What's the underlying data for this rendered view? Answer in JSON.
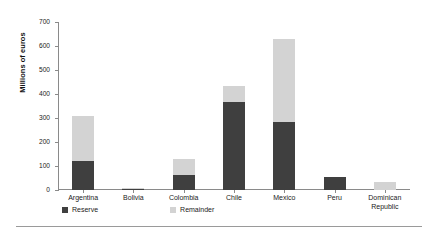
{
  "chart_data": {
    "type": "bar",
    "subtype": "stacked-vertical",
    "title": "",
    "subtitle": "",
    "xlabel": "",
    "ylabel": "Millions of euros",
    "categories": [
      "Argentina",
      "Bolivia",
      "Colombia",
      "Chile",
      "Mexico",
      "Peru",
      "Dominican Republic"
    ],
    "series": [
      {
        "name": "Reserve",
        "color": "#3f3f3f",
        "values": [
          120,
          3,
          63,
          365,
          283,
          55,
          2
        ]
      },
      {
        "name": "Remainder",
        "color": "#d3d3d3",
        "values": [
          190,
          7,
          67,
          70,
          347,
          0,
          33
        ]
      }
    ],
    "totals": [
      310,
      10,
      130,
      435,
      630,
      55,
      35
    ],
    "ylim": [
      0,
      700
    ],
    "ytick_step": 100,
    "yticks": [
      0,
      100,
      200,
      300,
      400,
      500,
      600,
      700
    ],
    "ytick_labels": [
      "0",
      "100",
      "200",
      "300",
      "400",
      "500",
      "600",
      "700"
    ],
    "grid": false,
    "legend_position": "bottom-left",
    "axis_color": "#8a8a8a"
  },
  "legend": {
    "items": [
      {
        "label": "Reserve",
        "color": "#3f3f3f"
      },
      {
        "label": "Remainder",
        "color": "#d3d3d3"
      }
    ]
  },
  "axis": {
    "ylabel": "Millions of euros",
    "ytick_labels": [
      "700",
      "600",
      "500",
      "400",
      "300",
      "200",
      "100",
      "0"
    ],
    "xtick_labels": [
      "Argentina",
      "Bolivia",
      "Colombia",
      "Chile",
      "Mexico",
      "Peru",
      "Dominican Republic"
    ]
  }
}
